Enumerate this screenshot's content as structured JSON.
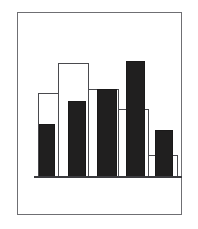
{
  "figure": {
    "frame": {
      "color": "#6f6f73",
      "x": 17,
      "y": 12,
      "width": 165,
      "height": 203
    },
    "background": "#ffffff"
  },
  "chart_data": {
    "type": "bar",
    "title": "",
    "subtitle": "",
    "xlabel": "",
    "ylabel": "",
    "categories": [
      "1",
      "2",
      "3",
      "4",
      "5"
    ],
    "grid": false,
    "legend": "none",
    "ylim": [
      0,
      100
    ],
    "xlim": [
      0,
      5
    ],
    "series": [
      {
        "name": "Outlined",
        "style": "white-fill-dark-outline",
        "fill": "#ffffff",
        "stroke": "#4a4a4e",
        "values": [
          59,
          74,
          61,
          51,
          16
        ]
      },
      {
        "name": "Filled",
        "style": "solid-dark-fill",
        "fill": "#201f1f",
        "stroke": "#1a1919",
        "values": [
          38,
          51,
          61,
          79,
          33
        ]
      }
    ],
    "baseline": {
      "y": 0,
      "color": "#3b3b3f"
    }
  },
  "bars": {
    "white": [
      {
        "name": "white-bar-1",
        "left": 20,
        "top": 80,
        "width": 30,
        "height": 84
      },
      {
        "name": "white-bar-2",
        "left": 40,
        "top": 50,
        "width": 31,
        "height": 114
      },
      {
        "name": "white-bar-3",
        "left": 70,
        "top": 76,
        "width": 31,
        "height": 88
      },
      {
        "name": "white-bar-4",
        "left": 100,
        "top": 96,
        "width": 31,
        "height": 68
      },
      {
        "name": "white-bar-5",
        "left": 130,
        "top": 142,
        "width": 30,
        "height": 22
      }
    ],
    "black": [
      {
        "name": "black-bar-1",
        "left": 21,
        "top": 111,
        "width": 16,
        "height": 53
      },
      {
        "name": "black-bar-2",
        "left": 50,
        "top": 88,
        "width": 18,
        "height": 76
      },
      {
        "name": "black-bar-3",
        "left": 79,
        "top": 76,
        "width": 20,
        "height": 88
      },
      {
        "name": "black-bar-4",
        "left": 108,
        "top": 48,
        "width": 19,
        "height": 116
      },
      {
        "name": "black-bar-5",
        "left": 137,
        "top": 117,
        "width": 18,
        "height": 47
      }
    ],
    "baseline": {
      "left": 16,
      "top": 163,
      "width": 148,
      "height": 1.6
    }
  }
}
